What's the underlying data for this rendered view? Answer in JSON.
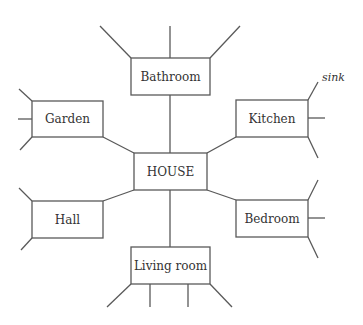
{
  "diagram": {
    "type": "spider-diagram",
    "colors": {
      "stroke": "#595959",
      "text": "#333333",
      "background": "#ffffff"
    },
    "center": {
      "id": "house",
      "label": "HOUSE"
    },
    "nodes": [
      {
        "id": "bathroom",
        "label": "Bathroom"
      },
      {
        "id": "garden",
        "label": "Garden"
      },
      {
        "id": "kitchen",
        "label": "Kitchen"
      },
      {
        "id": "hall",
        "label": "Hall"
      },
      {
        "id": "bedroom",
        "label": "Bedroom"
      },
      {
        "id": "living-room",
        "label": "Living room"
      }
    ],
    "annotations": [
      {
        "attached_to": "kitchen",
        "text": "sink"
      }
    ]
  }
}
